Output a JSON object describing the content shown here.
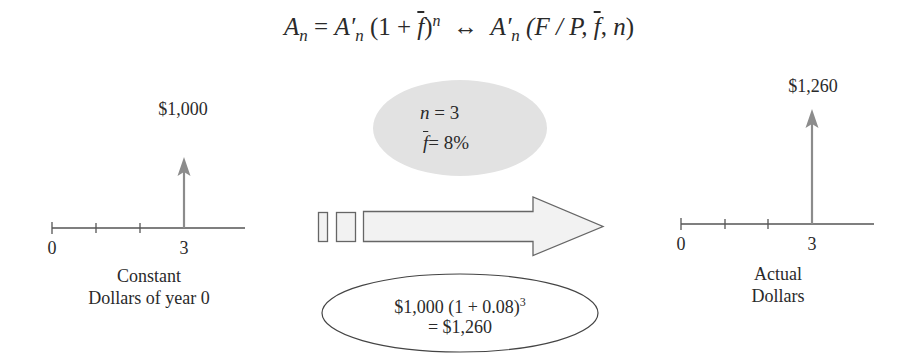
{
  "formula": {
    "lhs_symbol": "A",
    "lhs_subscript": "n",
    "equals": "=",
    "rhs_symbol": "A′",
    "rhs_subscript": "n",
    "paren_open": "(1 + ",
    "f_bar": "f",
    "paren_close": ")",
    "exponent": "n",
    "equivalence": "↔",
    "factor_symbol": "A′",
    "factor_subscript": "n",
    "factor_open": "(F / P, ",
    "factor_f_bar": "f",
    "factor_sep": ", ",
    "factor_n": "n",
    "factor_close": ")"
  },
  "left_timeline": {
    "cash_flow_label": "$1,000",
    "tick_labels": [
      "0",
      "3"
    ],
    "caption_line1": "Constant",
    "caption_line2": "Dollars of year 0"
  },
  "right_timeline": {
    "cash_flow_label": "$1,260",
    "tick_labels": [
      "0",
      "3"
    ],
    "caption_line1": "Actual",
    "caption_line2": "Dollars"
  },
  "parameters": {
    "n_label": "n",
    "n_value": " = 3",
    "f_label": "f",
    "f_value": "= 8%"
  },
  "calculation": {
    "line1_base": "$1,000 (1 + 0.08)",
    "line1_exponent": "3",
    "line2": "= $1,260"
  },
  "colors": {
    "arrow_gray": "#8c8c8c",
    "ellipse_fill": "#e2e2e2",
    "big_arrow_fill": "#f2f2f2",
    "line_color": "#555555"
  }
}
